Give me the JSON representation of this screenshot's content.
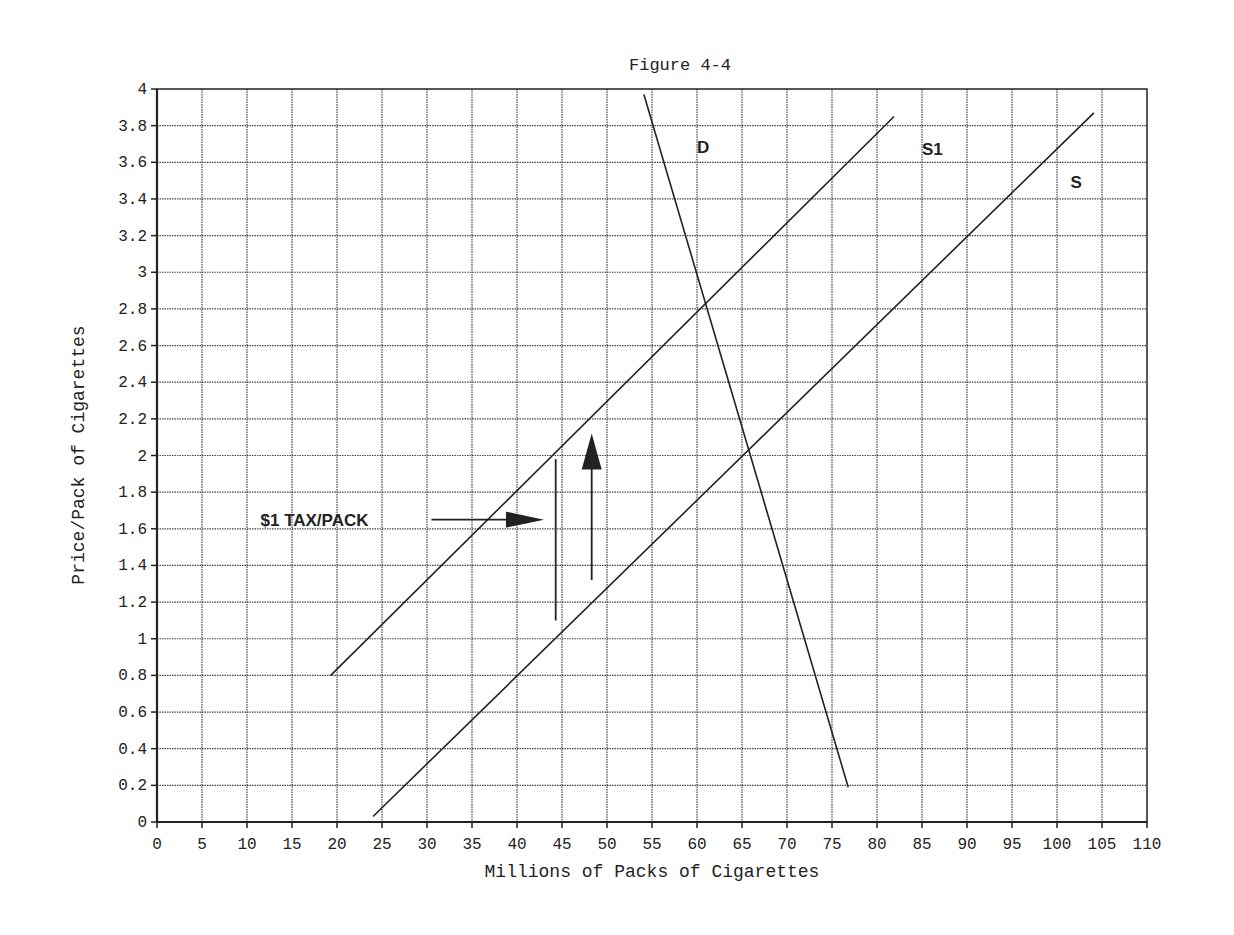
{
  "chart_data": {
    "type": "line",
    "title": "Figure 4-4",
    "xlabel": "Millions of Packs of Cigarettes",
    "ylabel": "Price/Pack of Cigarettes",
    "xlim": [
      0,
      110
    ],
    "ylim": [
      0,
      4
    ],
    "x_ticks": [
      0,
      5,
      10,
      15,
      20,
      25,
      30,
      35,
      40,
      45,
      50,
      55,
      60,
      65,
      70,
      75,
      80,
      85,
      90,
      95,
      100,
      105,
      110
    ],
    "y_ticks": [
      0,
      0.2,
      0.4,
      0.6,
      0.8,
      1,
      1.2,
      1.4,
      1.6,
      1.8,
      2,
      2.2,
      2.4,
      2.6,
      2.8,
      3,
      3.2,
      3.4,
      3.6,
      3.8,
      4
    ],
    "y_tick_labels": [
      "0",
      "0.2",
      "0.4",
      "0.6",
      "0.8",
      "1",
      "1.2",
      "1.4",
      "1.6",
      "1.8",
      "2",
      "2.2",
      "2.4",
      "2.6",
      "2.8",
      "3",
      "3.2",
      "3.4",
      "3.6",
      "3.8",
      "4"
    ],
    "grid": true,
    "series": [
      {
        "name": "D",
        "points": [
          [
            54.1,
            3.97
          ],
          [
            76.8,
            0.19
          ]
        ],
        "label_at": [
          60,
          3.65
        ]
      },
      {
        "name": "S1",
        "points": [
          [
            19.3,
            0.8
          ],
          [
            81.9,
            3.85
          ]
        ],
        "label_at": [
          85,
          3.64
        ]
      },
      {
        "name": "S",
        "points": [
          [
            24.0,
            0.03
          ],
          [
            104.1,
            3.87
          ]
        ],
        "label_at": [
          101.5,
          3.46
        ]
      }
    ],
    "annotations": [
      {
        "text": "$1 TAX/PACK",
        "type": "label-with-arrow",
        "at": [
          11.5,
          1.65
        ],
        "arrow_from": [
          30.5,
          1.65
        ],
        "arrow_to": [
          43,
          1.65
        ]
      },
      {
        "type": "vertical-line",
        "x": 44.3,
        "y_from": 1.1,
        "y_to": 1.98
      },
      {
        "type": "up-arrow",
        "x": 48.3,
        "y_from": 1.32,
        "y_to": 2.12
      }
    ]
  }
}
